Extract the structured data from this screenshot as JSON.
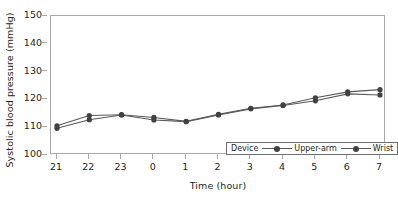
{
  "chart_data": {
    "type": "line",
    "title": "",
    "xlabel": "Time (hour)",
    "ylabel": "Systolic blood pressure (mmHg)",
    "x": [
      21,
      22,
      23,
      0,
      1,
      2,
      3,
      4,
      5,
      6,
      7
    ],
    "xtick_labels": [
      "21",
      "22",
      "23",
      "0",
      "1",
      "2",
      "3",
      "4",
      "5",
      "6",
      "7"
    ],
    "ytick_labels": [
      "100",
      "110",
      "120",
      "130",
      "140",
      "150"
    ],
    "yticks": [
      100,
      110,
      120,
      130,
      140,
      150
    ],
    "ylim": [
      100,
      150
    ],
    "grid": false,
    "legend_position": "lower-right",
    "legend_title": "Device",
    "series": [
      {
        "name": "Upper-arm",
        "color": "#414042",
        "marker": "circle",
        "values": [
          110.5,
          114.2,
          114.5,
          113.5,
          112.1,
          114.6,
          116.8,
          118.0,
          120.6,
          122.7,
          123.5
        ]
      },
      {
        "name": "Wrist",
        "color": "#414042",
        "marker": "circle",
        "values": [
          109.6,
          112.7,
          114.4,
          112.6,
          112.0,
          114.4,
          116.6,
          117.8,
          119.5,
          122.0,
          121.6
        ]
      }
    ]
  },
  "axis": {
    "y_title": "Systolic blood pressure (mmHg)",
    "x_title": "Time (hour)"
  },
  "legend": {
    "title": "Device",
    "entries": [
      {
        "label": "Upper-arm"
      },
      {
        "label": "Wrist"
      }
    ]
  },
  "colors": {
    "line": "#58595b",
    "marker": "#414042",
    "frame": "#a7a9ac",
    "text": "#231f20",
    "legend_border": "#6d6e71"
  }
}
